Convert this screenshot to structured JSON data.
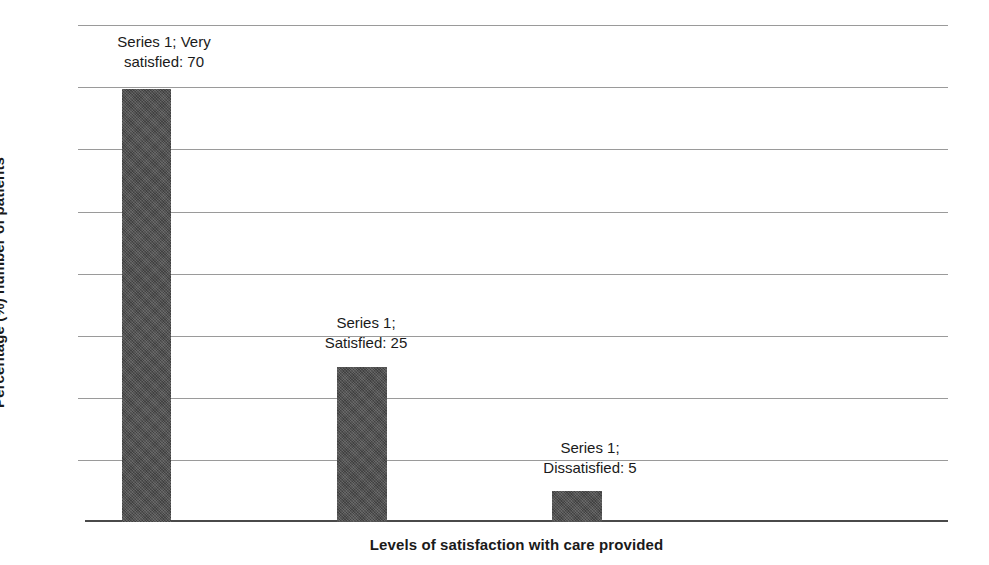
{
  "chart_data": {
    "type": "bar",
    "title": "",
    "categories": [
      "Very satisfied",
      "Satisfied",
      "Dissatisfied"
    ],
    "values": [
      70,
      25,
      5
    ],
    "series": [
      {
        "name": "Series 1",
        "values": [
          70,
          25,
          5
        ]
      }
    ],
    "data_labels": [
      {
        "line1": "Series 1; Very",
        "line2": "satisfied: 70",
        "value": 70
      },
      {
        "line1": "Series 1;",
        "line2": "Satisfied: 25",
        "value": 25
      },
      {
        "line1": "Series 1;",
        "line2": "Dissatisfied: 5",
        "value": 5
      }
    ],
    "xlabel": "Levels of satisfaction with care provided",
    "ylabel": "Percentage (%) number of patients",
    "ylim": [
      0,
      80
    ],
    "ytick_values": [
      0,
      10,
      20,
      30,
      40,
      50,
      60,
      70,
      80
    ],
    "ytick_labels": [
      "",
      "",
      "",
      "",
      "",
      "",
      "",
      "",
      ""
    ],
    "xtick_labels": [
      "",
      "",
      ""
    ],
    "grid": true,
    "legend": "none",
    "bar_color": "#4d4d4d",
    "gridline_color": "#9a9a9a",
    "axis_color": "#4a4a4a",
    "background_color": "#ffffff"
  },
  "axes": {
    "y_title": "Percentage (%) number of patients",
    "x_title": "Levels of satisfaction with care provided"
  }
}
